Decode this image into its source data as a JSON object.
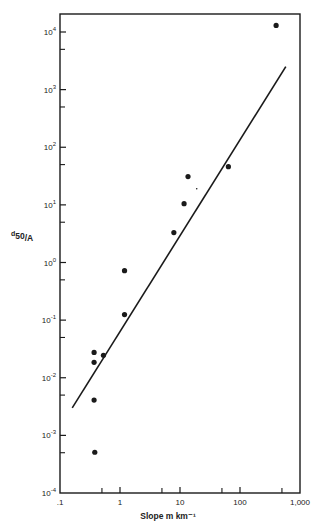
{
  "chart_data": {
    "type": "scatter",
    "title": "",
    "xlabel": "Slope  m km⁻¹",
    "ylabel": "d50/A",
    "ylabel_main": "d",
    "ylabel_sub": "50",
    "ylabel_tail": "/A",
    "xscale": "log",
    "yscale": "log",
    "xlim": [
      0.1,
      1000
    ],
    "ylim": [
      0.0001,
      10000
    ],
    "grid": false,
    "legend": null,
    "x_ticks": [
      {
        "value": 0.1,
        "label": ".1"
      },
      {
        "value": 1,
        "label": "1"
      },
      {
        "value": 10,
        "label": "10"
      },
      {
        "value": 100,
        "label": "100"
      },
      {
        "value": 1000,
        "label": "1,000"
      }
    ],
    "x_minor_ticks": [
      0.5,
      5,
      50,
      500
    ],
    "y_ticks": [
      {
        "value": 0.0001,
        "base": "10",
        "exp": "-4"
      },
      {
        "value": 0.001,
        "base": "10",
        "exp": "-3"
      },
      {
        "value": 0.01,
        "base": "10",
        "exp": "-2"
      },
      {
        "value": 0.1,
        "base": "10",
        "exp": "-1"
      },
      {
        "value": 1,
        "base": "10",
        "exp": "0"
      },
      {
        "value": 10,
        "base": "10",
        "exp": "1"
      },
      {
        "value": 100,
        "base": "10",
        "exp": "2"
      },
      {
        "value": 1000,
        "base": "10",
        "exp": "3"
      },
      {
        "value": 10000,
        "base": "10",
        "exp": "4"
      }
    ],
    "y_minor_ticks": [
      0.0005,
      0.005,
      0.05,
      0.5,
      5,
      50,
      500,
      5000
    ],
    "series": [
      {
        "name": "observations",
        "marker": "filled-circle",
        "points": [
          {
            "x": 400,
            "y": 13000
          },
          {
            "x": 64,
            "y": 46
          },
          {
            "x": 13.6,
            "y": 31
          },
          {
            "x": 11.7,
            "y": 10.5
          },
          {
            "x": 7.9,
            "y": 3.3
          },
          {
            "x": 1.19,
            "y": 0.72
          },
          {
            "x": 1.19,
            "y": 0.125
          },
          {
            "x": 0.37,
            "y": 0.0275
          },
          {
            "x": 0.53,
            "y": 0.0245
          },
          {
            "x": 0.37,
            "y": 0.0185
          },
          {
            "x": 0.37,
            "y": 0.0041
          },
          {
            "x": 0.38,
            "y": 0.00051
          }
        ]
      },
      {
        "name": "fitted line",
        "marker": "line",
        "points": [
          {
            "x": 0.16,
            "y": 0.003
          },
          {
            "x": 580,
            "y": 2500
          }
        ]
      }
    ],
    "annotations": [
      {
        "type": "stray-dot",
        "x": 19,
        "y": 19
      }
    ]
  },
  "colors": {
    "ink": "#1a1a1a",
    "background": "#ffffff"
  }
}
